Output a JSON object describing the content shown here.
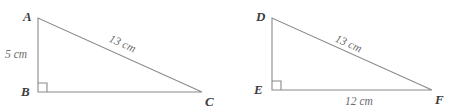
{
  "figure": {
    "type": "geometry-diagram",
    "background_color": "#ffffff",
    "stroke_color": "#8a8a8a",
    "label_color": "#3c3c3c",
    "measure_color": "#6b6b6b",
    "triangles": [
      {
        "id": "abc",
        "name": "triangle-abc",
        "vertices": [
          {
            "name": "A",
            "label": "A",
            "x": 38,
            "y": 18,
            "label_x": 23,
            "label_y": 10
          },
          {
            "name": "B",
            "label": "B",
            "x": 38,
            "y": 92,
            "label_x": 21,
            "label_y": 85
          },
          {
            "name": "C",
            "label": "C",
            "x": 202,
            "y": 92,
            "label_x": 205,
            "label_y": 95
          }
        ],
        "right_angle_at": "B",
        "measures": [
          {
            "name": "leg-ab",
            "text": "5 cm",
            "x": 5,
            "y": 49,
            "rotation": 0
          },
          {
            "name": "hypotenuse-ac",
            "text": "13 cm",
            "x": 112,
            "y": 33,
            "rotation": 24
          }
        ]
      },
      {
        "id": "def",
        "name": "triangle-def",
        "vertices": [
          {
            "name": "D",
            "label": "D",
            "x": 272,
            "y": 18,
            "label_x": 256,
            "label_y": 10
          },
          {
            "name": "E",
            "label": "E",
            "x": 272,
            "y": 90,
            "label_x": 254,
            "label_y": 83
          },
          {
            "name": "F",
            "label": "F",
            "x": 432,
            "y": 90,
            "label_x": 435,
            "label_y": 93
          }
        ],
        "right_angle_at": "E",
        "measures": [
          {
            "name": "hypotenuse-df",
            "text": "13 cm",
            "x": 338,
            "y": 33,
            "rotation": 24
          },
          {
            "name": "leg-ef",
            "text": "12 cm",
            "x": 345,
            "y": 96,
            "rotation": 0
          }
        ]
      }
    ]
  }
}
